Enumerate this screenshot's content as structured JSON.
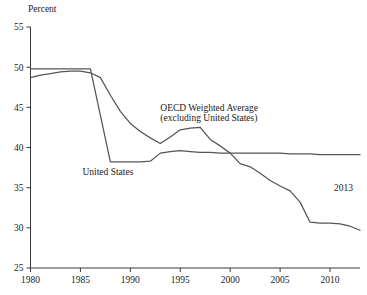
{
  "chart_data": {
    "type": "line",
    "title": "",
    "subtitle": "",
    "xlabel": "",
    "ylabel": "Percent",
    "xlim": [
      1980,
      2013
    ],
    "ylim": [
      25,
      55
    ],
    "yticks": [
      25,
      30,
      35,
      40,
      45,
      50,
      55
    ],
    "xticks": [
      1980,
      1985,
      1990,
      1995,
      2000,
      2005,
      2010
    ],
    "grid": false,
    "legend_position": "inline-annotations",
    "annotations": [
      {
        "name": "oecd-label",
        "text": "OECD Weighted Average",
        "x": 1993.0,
        "y": 44.6
      },
      {
        "name": "oecd-label-line2",
        "text": "(excluding United States)",
        "x": 1993.0,
        "y": 43.3
      },
      {
        "name": "us-label",
        "text": "United States",
        "x": 1985.2,
        "y": 36.6
      },
      {
        "name": "year-label",
        "text": "2013",
        "x": 2010.4,
        "y": 34.6
      }
    ],
    "x": [
      1980,
      1981,
      1982,
      1983,
      1984,
      1985,
      1986,
      1987,
      1988,
      1989,
      1990,
      1991,
      1992,
      1993,
      1994,
      1995,
      1996,
      1997,
      1998,
      1999,
      2000,
      2001,
      2002,
      2003,
      2004,
      2005,
      2006,
      2007,
      2008,
      2009,
      2010,
      2011,
      2012,
      2013
    ],
    "series": [
      {
        "name": "United States",
        "color": "#555555",
        "values": [
          49.8,
          49.8,
          49.8,
          49.8,
          49.8,
          49.8,
          49.8,
          44.0,
          38.2,
          38.2,
          38.2,
          38.2,
          38.3,
          39.3,
          39.5,
          39.6,
          39.5,
          39.4,
          39.4,
          39.3,
          39.3,
          39.3,
          39.3,
          39.3,
          39.3,
          39.3,
          39.2,
          39.2,
          39.2,
          39.1,
          39.1,
          39.1,
          39.1,
          39.1
        ]
      },
      {
        "name": "OECD Weighted Average (excluding United States)",
        "color": "#555555",
        "values": [
          48.7,
          49.0,
          49.2,
          49.4,
          49.5,
          49.5,
          49.3,
          48.7,
          46.5,
          44.5,
          43.0,
          42.0,
          41.2,
          40.5,
          41.3,
          42.2,
          42.4,
          42.5,
          41.0,
          40.2,
          39.3,
          38.0,
          37.6,
          36.8,
          35.9,
          35.2,
          34.6,
          33.2,
          30.7,
          30.6,
          30.6,
          30.5,
          30.2,
          29.7
        ]
      }
    ]
  }
}
